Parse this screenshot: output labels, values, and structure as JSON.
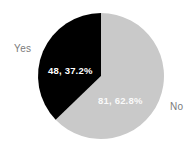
{
  "chart_data": {
    "type": "pie",
    "title": "",
    "categories": [
      "No",
      "Yes"
    ],
    "values": [
      81,
      48
    ],
    "percentages": [
      62.8,
      37.2
    ],
    "total": 129,
    "colors": [
      "#c9c9c9",
      "#000000"
    ],
    "start_angle_deg": 0,
    "direction": "clockwise",
    "legend": "none",
    "grid": false,
    "labels": [
      {
        "category": "No",
        "value": 81,
        "percent": 62.8,
        "text": "81, 62.8%",
        "color": "#c9c9c9",
        "text_color": "#ffffff"
      },
      {
        "category": "Yes",
        "value": 48,
        "percent": 37.2,
        "text": "48, 37.2%",
        "color": "#000000",
        "text_color": "#ffffff"
      }
    ]
  },
  "chart": {
    "background": "#ffffff",
    "category_label_color": "#7b7b7b",
    "slices": {
      "no": {
        "name": "No",
        "data_label": "81, 62.8%",
        "color": "#c9c9c9"
      },
      "yes": {
        "name": "Yes",
        "data_label": "48, 37.2%",
        "color": "#000000"
      }
    },
    "category_labels": {
      "yes": "Yes",
      "no": "No"
    }
  }
}
